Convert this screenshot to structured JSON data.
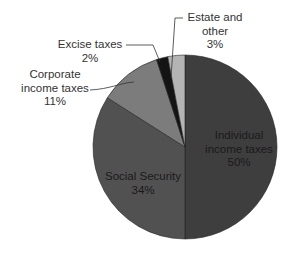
{
  "chart_data": {
    "type": "pie",
    "title": "",
    "start_angle_deg": 0,
    "direction": "clockwise",
    "slices": [
      {
        "label": "Individual income taxes",
        "value": 50,
        "display": "50%",
        "color": "#3e3e3e"
      },
      {
        "label": "Social Security",
        "value": 34,
        "display": "34%",
        "color": "#515151"
      },
      {
        "label": "Corporate income taxes",
        "value": 11,
        "display": "11%",
        "color": "#7c7c7c"
      },
      {
        "label": "Excise taxes",
        "value": 2,
        "display": "2%",
        "color": "#141414"
      },
      {
        "label": "Estate and other",
        "value": 3,
        "display": "3%",
        "color": "#b4b4b4"
      }
    ],
    "labels": {
      "individual": {
        "line1": "Individual",
        "line2": "income taxes",
        "pct": "50%"
      },
      "social": {
        "line1": "Social Security",
        "pct": "34%"
      },
      "corporate": {
        "line1": "Corporate",
        "line2": "income taxes",
        "pct": "11%"
      },
      "excise": {
        "line1": "Excise taxes",
        "pct": "2%"
      },
      "estate": {
        "line1": "Estate and",
        "line2": "other",
        "pct": "3%"
      }
    },
    "legend": "none (direct labels with leader lines)"
  }
}
